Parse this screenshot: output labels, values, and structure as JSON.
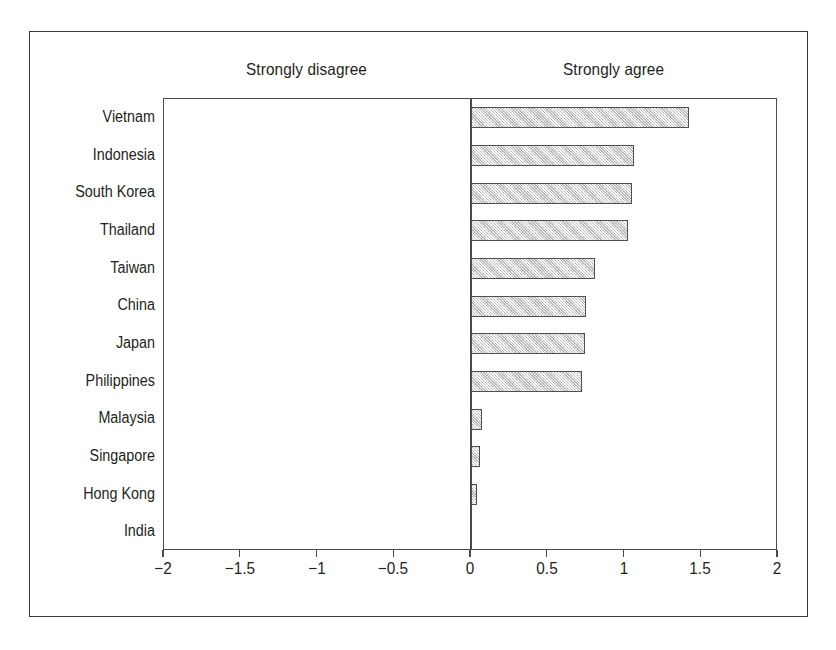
{
  "figure": {
    "background_color": "#ffffff",
    "frame_color": "#3a3a3a",
    "axis_color": "#4a4a4a",
    "bar_fill_color": "#d4d4d4",
    "bar_border_color": "#4f4f4f",
    "left_caption": "Strongly disagree",
    "right_caption": "Strongly agree"
  },
  "chart_data": {
    "type": "bar",
    "orientation": "horizontal",
    "title": "",
    "subtitle": "",
    "xlabel": "",
    "ylabel": "",
    "xlim": [
      -2,
      2
    ],
    "grid": false,
    "legend": null,
    "annotations": [
      {
        "text": "Strongly disagree",
        "position": "above-left-half"
      },
      {
        "text": "Strongly agree",
        "position": "above-right-half"
      }
    ],
    "xticks": [
      -2,
      -1.5,
      -1,
      -0.5,
      0,
      0.5,
      1,
      1.5,
      2
    ],
    "xtick_labels": [
      "−2",
      "−1.5",
      "−1",
      "−0.5",
      "0",
      "0.5",
      "1",
      "1.5",
      "2"
    ],
    "categories": [
      "Vietnam",
      "Indonesia",
      "South Korea",
      "Thailand",
      "Taiwan",
      "China",
      "Japan",
      "Philippines",
      "Malaysia",
      "Singapore",
      "Hong Kong",
      "India"
    ],
    "values": [
      1.42,
      1.06,
      1.05,
      1.02,
      0.81,
      0.75,
      0.74,
      0.72,
      0.07,
      0.06,
      0.04,
      0.0
    ]
  }
}
